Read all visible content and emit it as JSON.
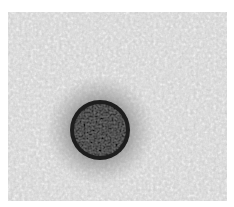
{
  "image": {
    "description": "Grayscale electron micrograph showing a single dark spherical particle on a noisy gray background",
    "background_color": "#cfcfcf",
    "particle_color": "#1e1e1e",
    "halo_color": "#8a8a8a",
    "border_color": "#ffffff"
  }
}
